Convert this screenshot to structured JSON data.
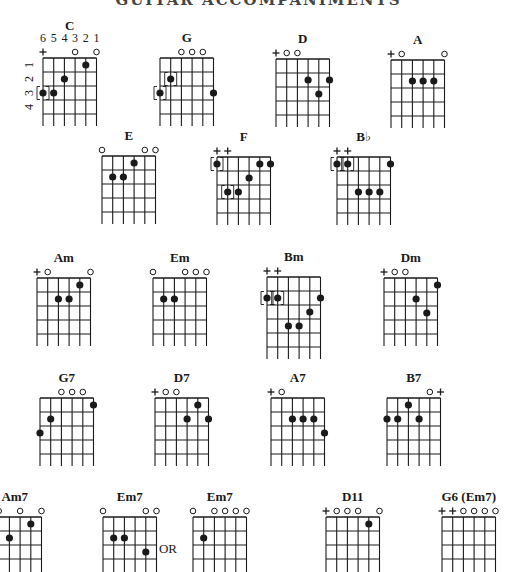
{
  "title": "GUITAR ACCOMPANIMENTS",
  "string_numbers": [
    "6",
    "5",
    "4",
    "3",
    "2",
    "1"
  ],
  "fret_numbers": [
    "1",
    "2",
    "3",
    "4"
  ],
  "or_label": "OR",
  "legend": {
    "open": "○",
    "muted": "+",
    "bracketed": "[●] optional"
  },
  "chords": [
    {
      "name": "C",
      "x": 43,
      "y": 58,
      "frets": 4,
      "markers": {
        "6": "+",
        "3": "o",
        "1": "o"
      },
      "dots": [
        {
          "s": 6,
          "f": 3,
          "b": true
        },
        {
          "s": 5,
          "f": 3
        },
        {
          "s": 4,
          "f": 2
        },
        {
          "s": 2,
          "f": 1
        }
      ]
    },
    {
      "name": "G",
      "x": 160,
      "y": 58,
      "frets": 4,
      "markers": {
        "4": "o",
        "3": "o",
        "2": "o"
      },
      "dots": [
        {
          "s": 5,
          "f": 2,
          "b": true
        },
        {
          "s": 6,
          "f": 3,
          "b": true
        },
        {
          "s": 1,
          "f": 3
        }
      ]
    },
    {
      "name": "D",
      "x": 276,
      "y": 59,
      "frets": 4,
      "markers": {
        "6": "+",
        "5": "o",
        "4": "o"
      },
      "dots": [
        {
          "s": 3,
          "f": 2
        },
        {
          "s": 1,
          "f": 2
        },
        {
          "s": 2,
          "f": 3
        }
      ]
    },
    {
      "name": "A",
      "x": 391,
      "y": 60,
      "frets": 4,
      "markers": {
        "6": "+",
        "5": "o",
        "1": "o"
      },
      "dots": [
        {
          "s": 4,
          "f": 2
        },
        {
          "s": 3,
          "f": 2
        },
        {
          "s": 2,
          "f": 2
        }
      ]
    },
    {
      "name": "E",
      "x": 102,
      "y": 156,
      "frets": 4,
      "markers": {
        "6": "o",
        "2": "o",
        "1": "o"
      },
      "dots": [
        {
          "s": 3,
          "f": 1
        },
        {
          "s": 5,
          "f": 2
        },
        {
          "s": 4,
          "f": 2
        }
      ]
    },
    {
      "name": "F",
      "x": 217,
      "y": 157,
      "frets": 4,
      "markers": {
        "6": "+",
        "5": "+"
      },
      "dots": [
        {
          "s": 6,
          "f": 1,
          "b": true
        },
        {
          "s": 2,
          "f": 1
        },
        {
          "s": 1,
          "f": 1
        },
        {
          "s": 3,
          "f": 2
        },
        {
          "s": 5,
          "f": 3,
          "b": true
        },
        {
          "s": 4,
          "f": 3
        }
      ]
    },
    {
      "name": "B♭",
      "x": 337,
      "y": 157,
      "frets": 4,
      "markers": {
        "6": "+",
        "5": "+"
      },
      "dots": [
        {
          "s": 6,
          "f": 1,
          "b": true
        },
        {
          "s": 5,
          "f": 1,
          "b": true
        },
        {
          "s": 1,
          "f": 1
        },
        {
          "s": 4,
          "f": 3
        },
        {
          "s": 3,
          "f": 3
        },
        {
          "s": 2,
          "f": 3
        }
      ]
    },
    {
      "name": "Am",
      "x": 37,
      "y": 278,
      "frets": 4,
      "markers": {
        "6": "+",
        "5": "o",
        "1": "o"
      },
      "dots": [
        {
          "s": 2,
          "f": 1
        },
        {
          "s": 4,
          "f": 2
        },
        {
          "s": 3,
          "f": 2
        }
      ]
    },
    {
      "name": "Em",
      "x": 153,
      "y": 278,
      "frets": 4,
      "markers": {
        "6": "o",
        "3": "o",
        "2": "o",
        "1": "o"
      },
      "dots": [
        {
          "s": 5,
          "f": 2
        },
        {
          "s": 4,
          "f": 2
        }
      ]
    },
    {
      "name": "Bm",
      "x": 267,
      "y": 277,
      "frets": 5,
      "markers": {
        "6": "+",
        "5": "+"
      },
      "dots": [
        {
          "s": 6,
          "f": 2,
          "b": true
        },
        {
          "s": 5,
          "f": 2,
          "b": true
        },
        {
          "s": 1,
          "f": 2
        },
        {
          "s": 2,
          "f": 3
        },
        {
          "s": 4,
          "f": 4
        },
        {
          "s": 3,
          "f": 4
        }
      ]
    },
    {
      "name": "Dm",
      "x": 384,
      "y": 278,
      "frets": 4,
      "markers": {
        "6": "+",
        "5": "o",
        "4": "o"
      },
      "dots": [
        {
          "s": 1,
          "f": 1
        },
        {
          "s": 3,
          "f": 2
        },
        {
          "s": 2,
          "f": 3
        }
      ]
    },
    {
      "name": "G7",
      "x": 40,
      "y": 398,
      "frets": 4,
      "markers": {
        "4": "o",
        "3": "o",
        "2": "o"
      },
      "dots": [
        {
          "s": 1,
          "f": 1
        },
        {
          "s": 5,
          "f": 2
        },
        {
          "s": 6,
          "f": 3
        }
      ]
    },
    {
      "name": "D7",
      "x": 155,
      "y": 398,
      "frets": 4,
      "markers": {
        "6": "+",
        "5": "o",
        "4": "o"
      },
      "dots": [
        {
          "s": 2,
          "f": 1
        },
        {
          "s": 3,
          "f": 2
        },
        {
          "s": 1,
          "f": 2
        }
      ]
    },
    {
      "name": "A7",
      "x": 271,
      "y": 398,
      "frets": 4,
      "markers": {
        "6": "+",
        "5": "o"
      },
      "dots": [
        {
          "s": 4,
          "f": 2
        },
        {
          "s": 3,
          "f": 2
        },
        {
          "s": 2,
          "f": 2
        },
        {
          "s": 1,
          "f": 3
        }
      ]
    },
    {
      "name": "B7",
      "x": 387,
      "y": 398,
      "frets": 4,
      "markers": {
        "2": "o",
        "1": "+"
      },
      "dots": [
        {
          "s": 4,
          "f": 1
        },
        {
          "s": 6,
          "f": 2
        },
        {
          "s": 5,
          "f": 2
        },
        {
          "s": 3,
          "f": 2
        }
      ]
    },
    {
      "name": "Am7",
      "x": -12,
      "y": 517,
      "frets": 4,
      "markers": {
        "6": "+",
        "5": "o",
        "3": "o",
        "1": "o"
      },
      "dots": [
        {
          "s": 4,
          "f": 2
        },
        {
          "s": 2,
          "f": 1
        }
      ]
    },
    {
      "name": "Em7",
      "x": 103,
      "y": 517,
      "frets": 4,
      "markers": {
        "6": "o",
        "2": "o",
        "1": "o"
      },
      "dots": [
        {
          "s": 5,
          "f": 2
        },
        {
          "s": 4,
          "f": 2
        },
        {
          "s": 2,
          "f": 3
        }
      ]
    },
    {
      "name": "Em7",
      "x": 193,
      "y": 517,
      "frets": 4,
      "markers": {
        "6": "o",
        "4": "o",
        "3": "o",
        "2": "o",
        "1": "o"
      },
      "dots": [
        {
          "s": 5,
          "f": 2
        }
      ]
    },
    {
      "name": "D11",
      "x": 326,
      "y": 517,
      "frets": 4,
      "markers": {
        "6": "+",
        "5": "o",
        "4": "o",
        "3": "o",
        "1": "o"
      },
      "dots": [
        {
          "s": 2,
          "f": 1
        }
      ]
    },
    {
      "name": "G6 (Em7)",
      "x": 442,
      "y": 517,
      "frets": 4,
      "markers": {
        "6": "+",
        "5": "+",
        "4": "o",
        "3": "o",
        "2": "o",
        "1": "o"
      },
      "dots": []
    }
  ],
  "or_position": {
    "x": 168,
    "y": 553
  }
}
